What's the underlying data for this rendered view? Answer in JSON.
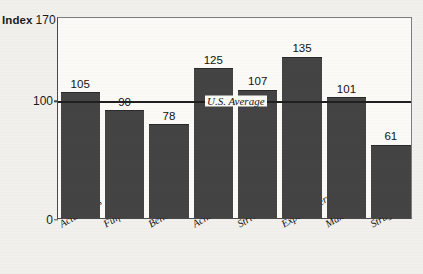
{
  "axis": {
    "index_label": "Index",
    "top_tick_label": "170",
    "mid_tick_label": "100",
    "bottom_tick_label": "0"
  },
  "annotation": {
    "average_label": "U.S. Average"
  },
  "chart_data": {
    "type": "bar",
    "title": "",
    "subtitle": "",
    "xlabel": "",
    "ylabel": "Index",
    "ylim": [
      0,
      170
    ],
    "ytick_values": [
      0,
      100,
      170
    ],
    "ytick_labels": [
      "0",
      "100",
      "170"
    ],
    "grid": false,
    "legend": false,
    "legend_position": "none",
    "bar_color": "#444444",
    "reference_line": {
      "label": "U.S. Average",
      "value": 100,
      "color": "#1f1f1f"
    },
    "categories": [
      "Actualizers",
      "Fulfilleds",
      "Believers",
      "Achievers",
      "Strivers",
      "Experiencers",
      "Makers",
      "Strugglers"
    ],
    "values": [
      105,
      90,
      78,
      125,
      107,
      135,
      101,
      61
    ],
    "value_labels": [
      "105",
      "90",
      "78",
      "125",
      "107",
      "135",
      "101",
      "61"
    ]
  }
}
